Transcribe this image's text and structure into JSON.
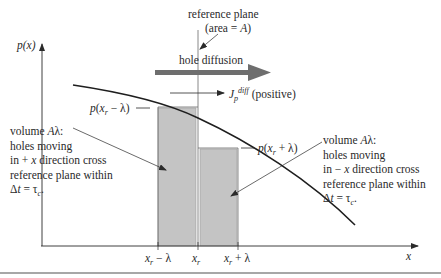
{
  "diagram": {
    "type": "physics-diagram",
    "axes": {
      "y_label": "p(x)",
      "x_label": "x",
      "x_ticks": [
        "x_r − λ",
        "x_r",
        "x_r + λ"
      ]
    },
    "reference_plane": {
      "line1": "reference plane",
      "line2": "(area = A)"
    },
    "hole_diffusion_label": "hole diffusion",
    "current_label": {
      "symbol": "J",
      "subscript": "p",
      "superscript": "diff",
      "suffix": "(positive)"
    },
    "bar_labels": {
      "left": "p(x_r − λ)",
      "right": "p(x_r + λ)"
    },
    "left_note": {
      "line1": "volume Aλ:",
      "line2": "holes moving",
      "line3": "in + x direction cross",
      "line4": "reference plane within",
      "line5": "Δt = τ_c."
    },
    "right_note": {
      "line1": "volume Aλ:",
      "line2": "holes moving",
      "line3": "in − x direction cross",
      "line4": "reference plane within",
      "line5": "Δt = τ_c."
    },
    "colors": {
      "line": "#2a2a2a",
      "bar_fill": "#c4c4c4",
      "diffusion_arrow": "#6e6e6e",
      "rule": "#8a8a8a"
    }
  }
}
